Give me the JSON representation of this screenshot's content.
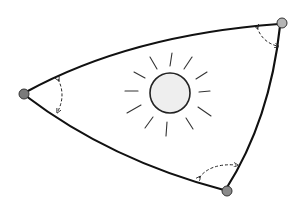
{
  "diagram": {
    "colors": {
      "background": "#ffffff",
      "edge": "#111111",
      "vertex_fill": "#8a8a8a",
      "sun_fill": "#eeeeee",
      "ray": "#333333"
    },
    "vertices": [
      {
        "id": "left",
        "x": 24,
        "y": 94
      },
      {
        "id": "top-right",
        "x": 282,
        "y": 23
      },
      {
        "id": "bottom",
        "x": 227,
        "y": 191
      }
    ],
    "sun": {
      "cx": 170,
      "cy": 93,
      "r": 20,
      "ray_count": 12
    },
    "angle_markers": 3
  }
}
